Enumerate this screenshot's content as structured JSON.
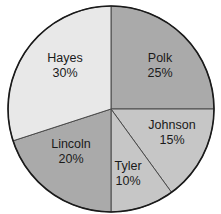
{
  "chart_data": {
    "type": "pie",
    "title": "",
    "categories": [
      "Polk",
      "Johnson",
      "Tyler",
      "Lincoln",
      "Hayes"
    ],
    "values": [
      25,
      15,
      10,
      20,
      30
    ],
    "unit": "%",
    "labels": [
      "25%",
      "15%",
      "10%",
      "20%",
      "30%"
    ],
    "start_angle_deg": -90,
    "direction": "clockwise",
    "legend": "none (labels inside slices)",
    "colors": [
      "#aaaaaa",
      "#c6c6c6",
      "#c6c6c6",
      "#aaaaaa",
      "#e8e8e8"
    ]
  },
  "style": {
    "outline_color": "#1a1a1a",
    "divider_color": "#4a4a4a"
  },
  "layout": {
    "cx": 111,
    "cy": 109,
    "r": 103,
    "label_positions": [
      [
        160,
        62
      ],
      [
        172,
        129
      ],
      [
        128,
        170
      ],
      [
        71,
        148
      ],
      [
        65,
        62
      ]
    ]
  }
}
